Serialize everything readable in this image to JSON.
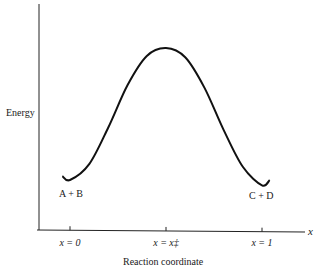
{
  "chart_data": {
    "type": "line",
    "title": "",
    "xlabel": "Reaction coordinate",
    "ylabel": "Energy",
    "x_axis_end_label": "x",
    "x_ticks": [
      {
        "value": 0,
        "label": "x = 0"
      },
      {
        "value": 0.5,
        "label": "x = x‡"
      },
      {
        "value": 1,
        "label": "x = 1"
      }
    ],
    "annotations": [
      {
        "text": "A + B",
        "at": "reactant minimum (x = 0)"
      },
      {
        "text": "C + D",
        "at": "product minimum (x = 1)"
      }
    ],
    "curve": {
      "description": "Energy profile: reactant well, transition-state maximum, product well",
      "x": [
        -0.04,
        0.0,
        0.1,
        0.2,
        0.3,
        0.4,
        0.5,
        0.6,
        0.7,
        0.8,
        0.9,
        1.0,
        1.04
      ],
      "y": [
        0.03,
        0.0,
        0.12,
        0.4,
        0.72,
        0.94,
        1.0,
        0.93,
        0.7,
        0.38,
        0.1,
        -0.04,
        0.0
      ]
    },
    "ylim": [
      -0.3,
      1.3
    ],
    "xlim": [
      -0.16,
      1.2
    ],
    "grid": false,
    "legend": "none"
  }
}
